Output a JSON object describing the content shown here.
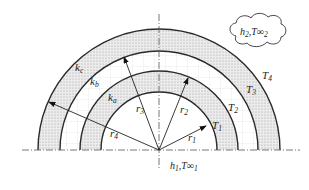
{
  "diagram": {
    "layers": [
      {
        "name": "layer-a",
        "label": "k",
        "sub": "a",
        "inner": "r1",
        "outer": "r2",
        "shaded": true
      },
      {
        "name": "layer-b",
        "label": "k",
        "sub": "b",
        "inner": "r2",
        "outer": "r3",
        "shaded": false
      },
      {
        "name": "layer-c",
        "label": "k",
        "sub": "c",
        "inner": "r3",
        "outer": "r4",
        "shaded": true
      }
    ],
    "radii": [
      {
        "label": "r",
        "sub": "1"
      },
      {
        "label": "r",
        "sub": "2"
      },
      {
        "label": "r",
        "sub": "3"
      },
      {
        "label": "r",
        "sub": "4"
      }
    ],
    "temperatures": [
      {
        "label": "T",
        "sub": "1"
      },
      {
        "label": "T",
        "sub": "2"
      },
      {
        "label": "T",
        "sub": "3"
      },
      {
        "label": "T",
        "sub": "4"
      }
    ],
    "inner_convection": {
      "h": "h",
      "h_sub": "1",
      "T": "T∞",
      "T_sub": "1"
    },
    "outer_convection": {
      "h": "h",
      "h_sub": "2",
      "T": "T∞",
      "T_sub": "2"
    },
    "colors": {
      "line": "#2a2a2a",
      "shade": "#e6e6e6",
      "dot": "#9a9a9a",
      "grid": "#dcdcdc",
      "axis": "#555555"
    }
  }
}
